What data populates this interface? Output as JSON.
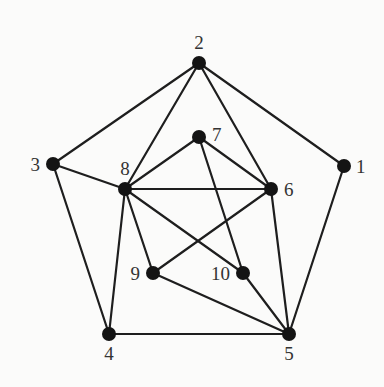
{
  "graph": {
    "nodes": [
      {
        "id": "1",
        "x": 344,
        "y": 166,
        "lx": 356,
        "ly": 173,
        "anchor": "start"
      },
      {
        "id": "2",
        "x": 199,
        "y": 63,
        "lx": 199,
        "ly": 49,
        "anchor": "middle"
      },
      {
        "id": "3",
        "x": 53,
        "y": 164,
        "lx": 40,
        "ly": 171,
        "anchor": "end"
      },
      {
        "id": "4",
        "x": 109,
        "y": 334,
        "lx": 109,
        "ly": 360,
        "anchor": "middle"
      },
      {
        "id": "5",
        "x": 289,
        "y": 334,
        "lx": 289,
        "ly": 360,
        "anchor": "middle"
      },
      {
        "id": "6",
        "x": 271,
        "y": 189,
        "lx": 284,
        "ly": 196,
        "anchor": "start"
      },
      {
        "id": "7",
        "x": 199,
        "y": 137,
        "lx": 212,
        "ly": 141,
        "anchor": "start"
      },
      {
        "id": "8",
        "x": 125,
        "y": 189,
        "lx": 125,
        "ly": 175,
        "anchor": "middle"
      },
      {
        "id": "9",
        "x": 153,
        "y": 273,
        "lx": 140,
        "ly": 280,
        "anchor": "end"
      },
      {
        "id": "10",
        "x": 243,
        "y": 273,
        "lx": 230,
        "ly": 280,
        "anchor": "end"
      }
    ],
    "edges": [
      [
        "2",
        "3"
      ],
      [
        "2",
        "1"
      ],
      [
        "2",
        "8"
      ],
      [
        "2",
        "6"
      ],
      [
        "3",
        "8"
      ],
      [
        "3",
        "4"
      ],
      [
        "1",
        "5"
      ],
      [
        "4",
        "5"
      ],
      [
        "4",
        "8"
      ],
      [
        "8",
        "7"
      ],
      [
        "8",
        "6"
      ],
      [
        "8",
        "9"
      ],
      [
        "8",
        "10"
      ],
      [
        "7",
        "6"
      ],
      [
        "7",
        "10"
      ],
      [
        "6",
        "9"
      ],
      [
        "6",
        "5"
      ],
      [
        "9",
        "5"
      ],
      [
        "10",
        "5"
      ]
    ]
  }
}
